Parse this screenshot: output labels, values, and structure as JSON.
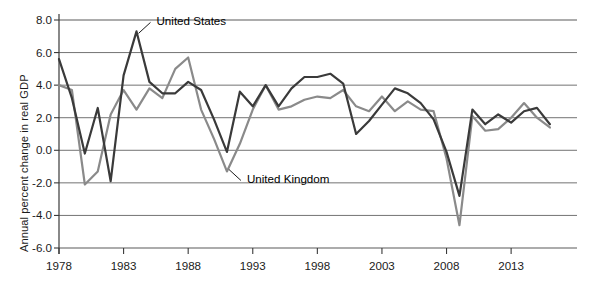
{
  "chart_data": {
    "type": "line",
    "title": "",
    "xlabel": "",
    "ylabel": "Annual percent change in real GDP",
    "xlim": [
      1978,
      2016
    ],
    "ylim": [
      -6.0,
      8.0
    ],
    "grid": true,
    "legend_position": "inline-annotation",
    "y_ticks": [
      "8.0",
      "6.0",
      "4.0",
      "2.0",
      "0.0",
      "-2.0",
      "-4.0",
      "-6.0"
    ],
    "y_tick_values": [
      8.0,
      6.0,
      4.0,
      2.0,
      0.0,
      -2.0,
      -4.0,
      -6.0
    ],
    "x_ticks": [
      "1978",
      "1983",
      "1988",
      "1993",
      "1998",
      "2003",
      "2008",
      "2013"
    ],
    "x_tick_values": [
      1978,
      1983,
      1988,
      1993,
      1998,
      2003,
      2008,
      2013
    ],
    "x": [
      1978,
      1979,
      1980,
      1981,
      1982,
      1983,
      1984,
      1985,
      1986,
      1987,
      1988,
      1989,
      1990,
      1991,
      1992,
      1993,
      1994,
      1995,
      1996,
      1997,
      1998,
      1999,
      2000,
      2001,
      2002,
      2003,
      2004,
      2005,
      2006,
      2007,
      2008,
      2009,
      2010,
      2011,
      2012,
      2013,
      2014,
      2015,
      2016
    ],
    "series": [
      {
        "name": "United States",
        "color": "#3a3a3a",
        "label_x": 2016,
        "values": [
          5.6,
          3.2,
          -0.2,
          2.6,
          -1.9,
          4.6,
          7.3,
          4.2,
          3.5,
          3.5,
          4.2,
          3.7,
          1.9,
          -0.1,
          3.6,
          2.7,
          4.0,
          2.7,
          3.8,
          4.5,
          4.5,
          4.7,
          4.1,
          1.0,
          1.8,
          2.8,
          3.8,
          3.5,
          2.9,
          1.9,
          -0.1,
          -2.8,
          2.5,
          1.6,
          2.2,
          1.7,
          2.4,
          2.6,
          1.6
        ]
      },
      {
        "name": "United Kingdom",
        "color": "#8a8a8a",
        "label_x": 2016,
        "values": [
          4.0,
          3.7,
          -2.1,
          -1.3,
          2.2,
          3.7,
          2.5,
          3.8,
          3.2,
          5.0,
          5.7,
          2.5,
          0.7,
          -1.3,
          0.4,
          2.5,
          4.0,
          2.5,
          2.7,
          3.1,
          3.3,
          3.2,
          3.7,
          2.7,
          2.4,
          3.3,
          2.4,
          3.0,
          2.5,
          2.4,
          -0.5,
          -4.6,
          2.1,
          1.2,
          1.3,
          2.0,
          2.9,
          2.0,
          1.4
        ]
      }
    ],
    "annotations": [
      {
        "text": "United States",
        "points_to_year": 1984,
        "points_to_value": 7.3
      },
      {
        "text": "United Kingdom",
        "points_to_year": 1991,
        "points_to_value": -1.3
      }
    ]
  }
}
